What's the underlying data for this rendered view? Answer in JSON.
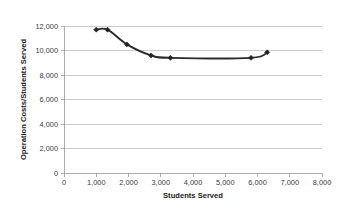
{
  "chart_data": {
    "type": "line",
    "title": "",
    "xlabel": "Students Served",
    "ylabel": "Operation Costs/Students Served",
    "xlim": [
      0,
      8000
    ],
    "ylim": [
      0,
      12000
    ],
    "grid": "horizontal",
    "legend": "none",
    "marker": "diamond",
    "line_color": "#2b2b2b",
    "x": [
      1000,
      1350,
      1950,
      2700,
      3300,
      5800,
      6300
    ],
    "values": [
      11700,
      11700,
      10500,
      9600,
      9400,
      9400,
      9850
    ],
    "points": [
      {
        "x": 1000,
        "y": 11700
      },
      {
        "x": 1350,
        "y": 11700
      },
      {
        "x": 1950,
        "y": 10500
      },
      {
        "x": 2700,
        "y": 9600
      },
      {
        "x": 3300,
        "y": 9400
      },
      {
        "x": 5800,
        "y": 9400
      },
      {
        "x": 6300,
        "y": 9850
      }
    ],
    "xticks": [
      0,
      1000,
      2000,
      3000,
      4000,
      5000,
      6000,
      7000,
      8000
    ],
    "xtick_labels": [
      "0",
      "1,000",
      "2,000",
      "3,000",
      "4,000",
      "5,000",
      "6,000",
      "7,000",
      "8,000"
    ],
    "yticks": [
      0,
      2000,
      4000,
      6000,
      8000,
      10000,
      12000
    ],
    "ytick_labels": [
      "0",
      "2,000",
      "4,000",
      "6,000",
      "8,000",
      "10,000",
      "12,000"
    ]
  }
}
